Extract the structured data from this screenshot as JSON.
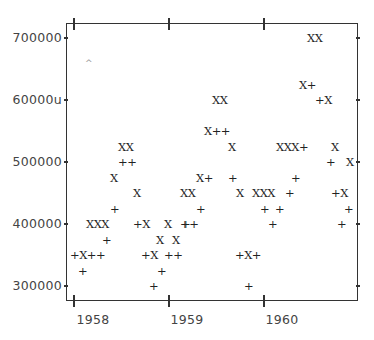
{
  "chart_data": {
    "type": "scatter",
    "title": "",
    "xlabel": "",
    "ylabel": "",
    "x_ticks": [
      "1958",
      "1959",
      "1960"
    ],
    "y_ticks": [
      "300000",
      "400000",
      "500000",
      "600000",
      "700000"
    ],
    "y_tick_label_rendered": [
      "300000",
      "400000",
      "500000",
      "60000u",
      "700000"
    ],
    "xlim": [
      1957.92,
      1960.96
    ],
    "ylim": [
      275000,
      725000
    ],
    "grid": false,
    "legend": "none",
    "marker_style": "character plot (lineprinter style)",
    "series": [
      {
        "name": "+",
        "marker": "+",
        "points": [
          {
            "x": "1958-01",
            "y": 350000
          },
          {
            "x": "1958-02",
            "y": 325000
          },
          {
            "x": "1958-03",
            "y": 350000
          },
          {
            "x": "1958-04",
            "y": 350000
          },
          {
            "x": "1958-05",
            "y": 375000
          },
          {
            "x": "1958-06",
            "y": 425000
          },
          {
            "x": "1958-07",
            "y": 500000
          },
          {
            "x": "1958-08",
            "y": 500000
          },
          {
            "x": "1958-09",
            "y": 400000
          },
          {
            "x": "1958-10",
            "y": 350000
          },
          {
            "x": "1958-11",
            "y": 300000
          },
          {
            "x": "1958-12",
            "y": 325000
          },
          {
            "x": "1959-01",
            "y": 350000
          },
          {
            "x": "1959-02",
            "y": 350000
          },
          {
            "x": "1959-03",
            "y": 400000
          },
          {
            "x": "1959-04",
            "y": 400000
          },
          {
            "x": "1959-05",
            "y": 425000
          },
          {
            "x": "1959-06",
            "y": 475000
          },
          {
            "x": "1959-07",
            "y": 550000
          },
          {
            "x": "1959-08",
            "y": 550000
          },
          {
            "x": "1959-09",
            "y": 475000
          },
          {
            "x": "1959-10",
            "y": 400000
          },
          {
            "x": "1959-11",
            "y": 400000
          },
          {
            "x": "1959-12",
            "y": 350000
          },
          {
            "x": "1960-01",
            "y": 425000
          },
          {
            "x": "1960-02",
            "y": 400000
          },
          {
            "x": "1960-03",
            "y": 425000
          },
          {
            "x": "1960-04",
            "y": 450000
          },
          {
            "x": "1960-05",
            "y": 475000
          },
          {
            "x": "1960-06",
            "y": 525000
          },
          {
            "x": "1960-07",
            "y": 625000
          },
          {
            "x": "1960-08",
            "y": 600000
          },
          {
            "x": "1960-09",
            "y": 500000
          },
          {
            "x": "1960-10",
            "y": 450000
          },
          {
            "x": "1960-11",
            "y": 400000
          },
          {
            "x": "1960-12",
            "y": 425000
          }
        ]
      },
      {
        "name": "X",
        "marker": "X",
        "points": [
          {
            "x": "1958-02",
            "y": 350000
          },
          {
            "x": "1958-03",
            "y": 400000
          },
          {
            "x": "1958-04",
            "y": 400000
          },
          {
            "x": "1958-05",
            "y": 400000
          },
          {
            "x": "1958-06",
            "y": 475000
          },
          {
            "x": "1958-07",
            "y": 525000
          },
          {
            "x": "1958-08",
            "y": 525000
          },
          {
            "x": "1958-09",
            "y": 450000
          },
          {
            "x": "1958-10",
            "y": 400000
          },
          {
            "x": "1958-11",
            "y": 350000
          },
          {
            "x": "1958-12",
            "y": 375000
          },
          {
            "x": "1959-01",
            "y": 400000
          },
          {
            "x": "1959-02",
            "y": 375000
          },
          {
            "x": "1959-03",
            "y": 450000
          },
          {
            "x": "1959-04",
            "y": 450000
          },
          {
            "x": "1959-05",
            "y": 475000
          },
          {
            "x": "1959-06",
            "y": 550000
          },
          {
            "x": "1959-07",
            "y": 600000
          },
          {
            "x": "1959-08",
            "y": 600000
          },
          {
            "x": "1959-09",
            "y": 525000
          },
          {
            "x": "1959-10",
            "y": 450000
          },
          {
            "x": "1959-11",
            "y": 400000
          },
          {
            "x": "1960-01",
            "y": 450000
          },
          {
            "x": "1960-02",
            "y": 450000
          },
          {
            "x": "1960-03",
            "y": 450000
          },
          {
            "x": "1960-05",
            "y": 525000
          },
          {
            "x": "1960-06",
            "y": 525000
          },
          {
            "x": "1960-07",
            "y": 525000
          },
          {
            "x": "1960-08",
            "y": 700000
          },
          {
            "x": "1960-09",
            "y": 700000
          },
          {
            "x": "1960-08",
            "y": 625000
          },
          {
            "x": "1960-09",
            "y": 600000
          },
          {
            "x": "1960-10",
            "y": 525000
          },
          {
            "x": "1960-11",
            "y": 450000
          },
          {
            "x": "1960-12",
            "y": 500000
          }
        ]
      }
    ]
  },
  "axes": {
    "y_labels": [
      {
        "text": "700000",
        "top": 31
      },
      {
        "text": "60000u",
        "top": 93
      },
      {
        "text": "500000",
        "top": 155
      },
      {
        "text": "400000",
        "top": 217
      },
      {
        "text": "300000",
        "top": 279
      }
    ],
    "x_labels": [
      {
        "text": "1958",
        "left": 54
      },
      {
        "text": "1959",
        "left": 149
      },
      {
        "text": "1960",
        "left": 244
      }
    ]
  },
  "glyph_runs": [
    {
      "text": "XX",
      "left": 118,
      "top": 141
    },
    {
      "text": "++",
      "left": 118,
      "top": 156
    },
    {
      "text": "X",
      "left": 110,
      "top": 172
    },
    {
      "text": "X",
      "left": 133,
      "top": 187
    },
    {
      "text": "+",
      "left": 110,
      "top": 203
    },
    {
      "text": "XXX",
      "left": 86,
      "top": 218
    },
    {
      "text": "+X",
      "left": 133,
      "top": 218
    },
    {
      "text": "X",
      "left": 164,
      "top": 218
    },
    {
      "text": "+",
      "left": 181,
      "top": 218
    },
    {
      "text": "+",
      "left": 102,
      "top": 234
    },
    {
      "text": "X",
      "left": 156,
      "top": 234
    },
    {
      "text": "X",
      "left": 172,
      "top": 234
    },
    {
      "text": "+X++",
      "left": 70,
      "top": 249
    },
    {
      "text": "+X",
      "left": 141,
      "top": 249
    },
    {
      "text": "++",
      "left": 164,
      "top": 249
    },
    {
      "text": "+",
      "left": 78,
      "top": 265
    },
    {
      "text": "+",
      "left": 157,
      "top": 265
    },
    {
      "text": "+",
      "left": 149,
      "top": 280
    },
    {
      "text": "XX",
      "left": 212,
      "top": 94
    },
    {
      "text": "X++",
      "left": 204,
      "top": 125
    },
    {
      "text": "X",
      "left": 228,
      "top": 141
    },
    {
      "text": "X+",
      "left": 196,
      "top": 172
    },
    {
      "text": "+",
      "left": 228,
      "top": 172
    },
    {
      "text": "XX",
      "left": 180,
      "top": 187
    },
    {
      "text": "X",
      "left": 236,
      "top": 187
    },
    {
      "text": "+",
      "left": 196,
      "top": 203
    },
    {
      "text": "++",
      "left": 180,
      "top": 218
    },
    {
      "text": "+X+",
      "left": 235,
      "top": 249
    },
    {
      "text": "+",
      "left": 244,
      "top": 280
    },
    {
      "text": "XX",
      "left": 307,
      "top": 32
    },
    {
      "text": "X+",
      "left": 299,
      "top": 79
    },
    {
      "text": "+X",
      "left": 315,
      "top": 94
    },
    {
      "text": "XXX+",
      "left": 276,
      "top": 141
    },
    {
      "text": "X",
      "left": 331,
      "top": 141
    },
    {
      "text": "+",
      "left": 326,
      "top": 156
    },
    {
      "text": "X",
      "left": 346,
      "top": 156
    },
    {
      "text": "+",
      "left": 291,
      "top": 172
    },
    {
      "text": "XXX",
      "left": 252,
      "top": 187
    },
    {
      "text": "+",
      "left": 285,
      "top": 187
    },
    {
      "text": "+X",
      "left": 331,
      "top": 187
    },
    {
      "text": "+",
      "left": 260,
      "top": 203
    },
    {
      "text": "+",
      "left": 275,
      "top": 203
    },
    {
      "text": "+",
      "left": 344,
      "top": 203
    },
    {
      "text": "+",
      "left": 268,
      "top": 218
    },
    {
      "text": "+",
      "left": 337,
      "top": 218
    }
  ]
}
